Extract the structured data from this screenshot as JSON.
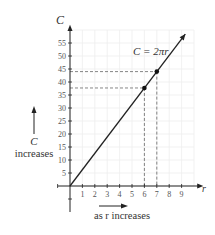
{
  "chart_data": {
    "type": "line",
    "title": "",
    "equation_label": "C = 2πr",
    "xlabel": "r",
    "ylabel": "C",
    "x_ticks": [
      "1",
      "2",
      "3",
      "4",
      "5",
      "6",
      "7",
      "8",
      "9"
    ],
    "y_ticks": [
      "5",
      "10",
      "15",
      "20",
      "25",
      "30",
      "35",
      "40",
      "45",
      "50",
      "55"
    ],
    "xlim": [
      -1,
      10.5
    ],
    "ylim": [
      -5,
      60
    ],
    "grid": true,
    "series": [
      {
        "name": "C = 2πr",
        "x": [
          0,
          10.5
        ],
        "y": [
          0,
          65.97
        ]
      }
    ],
    "highlighted_points": [
      {
        "x": 6,
        "y": 37.7
      },
      {
        "x": 7,
        "y": 44.0
      }
    ],
    "annotations": {
      "vertical_arrow_label_1": "C",
      "vertical_arrow_label_2": "increases",
      "horizontal_arrow_label": "as r increases"
    },
    "colors": {
      "axis": "#222222",
      "line": "#222222",
      "grid": "#eeeeee",
      "dashed": "#666666",
      "text": "#444444"
    }
  }
}
